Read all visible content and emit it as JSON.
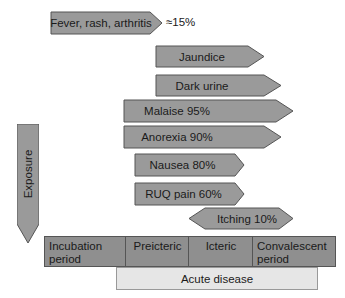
{
  "colors": {
    "arrow_fill": "#9a9a9a",
    "arrow_stroke": "#555555",
    "phase_fill": "#8f8f8f",
    "acute_fill": "#e6e6e6"
  },
  "symptoms": [
    {
      "label": "Fever, rash, arthritis",
      "note": "≈15%"
    },
    {
      "label": "Jaundice"
    },
    {
      "label": "Dark urine"
    },
    {
      "label": "Malaise 95%"
    },
    {
      "label": "Anorexia 90%"
    },
    {
      "label": "Nausea 80%"
    },
    {
      "label": "RUQ pain 60%"
    },
    {
      "label": "Itching 10%"
    }
  ],
  "exposure": {
    "label": "Exposure"
  },
  "phases": [
    {
      "label": "Incubation period"
    },
    {
      "label": "Preicteric"
    },
    {
      "label": "Icteric"
    },
    {
      "label": "Convalescent period"
    }
  ],
  "acute": {
    "label": "Acute disease"
  }
}
